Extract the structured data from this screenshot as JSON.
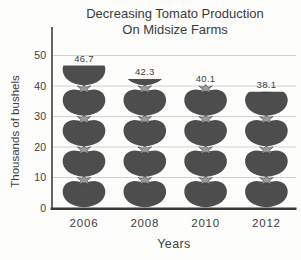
{
  "chart_data": {
    "type": "bar",
    "variant": "pictograph",
    "icon": "tomato-icon",
    "title_line1": "Decreasing Tomato Production",
    "title_line2": "On Midsize Farms",
    "categories": [
      "2006",
      "2008",
      "2010",
      "2012"
    ],
    "values": [
      46.7,
      42.3,
      40.1,
      38.1
    ],
    "value_labels": [
      "46.7",
      "42.3",
      "40.1",
      "38.1"
    ],
    "xlabel": "Years",
    "ylabel": "Thousands of bushels",
    "y_ticks": [
      0,
      10,
      20,
      30,
      40,
      50
    ],
    "ylim": [
      0,
      50
    ],
    "units_per_icon": 10,
    "grid": true,
    "legend": "none",
    "colors": {
      "tomato_body": "#4d4d4d",
      "tomato_stem_leaves": "#9a9a9a",
      "tomato_stem_outline": "#2f2f2f",
      "gridline": "#cbcbcb",
      "y_axis": "#4a4a4a",
      "x_axis": "#3a3a3a",
      "text": "#3d3d3d",
      "background": "#fdfdfb"
    }
  }
}
